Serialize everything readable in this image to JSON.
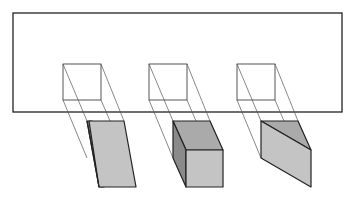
{
  "diagram": {
    "title": "",
    "colors": {
      "background": "#ffffff",
      "outline": "#222222",
      "projection_line": "#555555",
      "top_face": "#aaaaaa",
      "front_face": "#c4c4c4",
      "side_face": "#8a8a8a"
    },
    "picture_plane": {
      "x": 13,
      "y": 13,
      "width": 329,
      "height": 99
    },
    "projections": [
      {
        "name": "square-1",
        "x": 63,
        "y": 64,
        "size": 38
      },
      {
        "name": "square-2",
        "x": 149,
        "y": 64,
        "size": 38
      },
      {
        "name": "square-3",
        "x": 237,
        "y": 64,
        "size": 38
      }
    ],
    "solids": [
      {
        "name": "slanted-prism",
        "label": ""
      },
      {
        "name": "cube",
        "label": ""
      },
      {
        "name": "wedge",
        "label": ""
      }
    ]
  }
}
